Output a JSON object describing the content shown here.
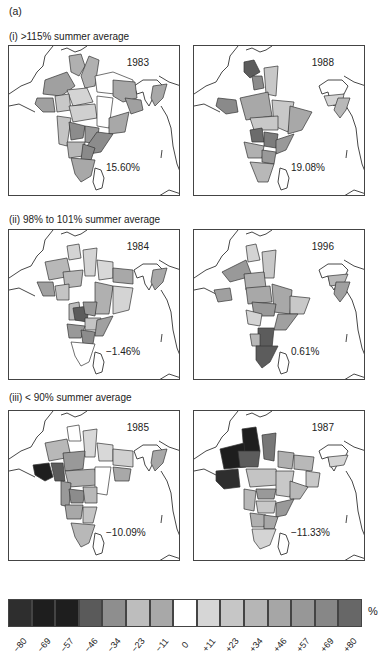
{
  "figure": {
    "panel_label": "(a)",
    "sections": [
      {
        "title": "(i) >115% summer average",
        "maps": [
          {
            "year": "1983",
            "anomaly": "15.60%"
          },
          {
            "year": "1988",
            "anomaly": "19.08%"
          }
        ]
      },
      {
        "title": "(ii) 98% to 101% summer average",
        "maps": [
          {
            "year": "1984",
            "anomaly": "−1.46%"
          },
          {
            "year": "1996",
            "anomaly": "0.61%"
          }
        ]
      },
      {
        "title": "(iii) < 90% summer average",
        "maps": [
          {
            "year": "1985",
            "anomaly": "−10.09%"
          },
          {
            "year": "1987",
            "anomaly": "−11.33%"
          }
        ]
      }
    ],
    "legend": {
      "unit": "%",
      "ticks": [
        "−80",
        "−69",
        "−57",
        "−46",
        "−34",
        "−23",
        "−11",
        "0",
        "+11",
        "+23",
        "+34",
        "+46",
        "+57",
        "+69",
        "+80"
      ],
      "colors": [
        "#2e2e2e",
        "#1e1e1e",
        "#1e1e1e",
        "#5a5a5a",
        "#8e8e8e",
        "#bdbdbd",
        "#a8a8a8",
        "#ffffff",
        "#d6d6d6",
        "#c6c6c6",
        "#b6b6b6",
        "#a6a6a6",
        "#979797",
        "#878787",
        "#676767"
      ]
    }
  },
  "chart_data": {
    "type": "heatmap",
    "panels": [
      {
        "section": "(i) >115% summer average",
        "year": 1983,
        "all_india_anomaly_pct": 15.6
      },
      {
        "section": "(i) >115% summer average",
        "year": 1988,
        "all_india_anomaly_pct": 19.08
      },
      {
        "section": "(ii) 98% to 101% summer average",
        "year": 1984,
        "all_india_anomaly_pct": -1.46
      },
      {
        "section": "(ii) 98% to 101% summer average",
        "year": 1996,
        "all_india_anomaly_pct": 0.61
      },
      {
        "section": "(iii) < 90% summer average",
        "year": 1985,
        "all_india_anomaly_pct": -10.09
      },
      {
        "section": "(iii) < 90% summer average",
        "year": 1987,
        "all_india_anomaly_pct": -11.33
      }
    ],
    "colorbar": {
      "label": "%",
      "ticks": [
        -80,
        -69,
        -57,
        -46,
        -34,
        -23,
        -11,
        0,
        11,
        23,
        34,
        46,
        57,
        69,
        80
      ],
      "scale": "grayscale, dark = large negative or large positive anomaly, white = 0"
    }
  }
}
